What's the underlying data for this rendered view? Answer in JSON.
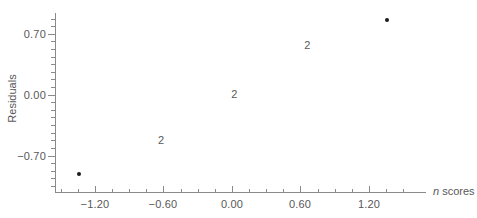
{
  "chart_data": {
    "type": "scatter",
    "title": "",
    "xlabel": "n scores",
    "ylabel": "Residuals",
    "xlim": [
      -1.55,
      1.7
    ],
    "ylim": [
      -1.12,
      0.94
    ],
    "grid": false,
    "legend": null,
    "x_ticks": [
      {
        "value": -1.2,
        "label": "-1.20"
      },
      {
        "value": -0.6,
        "label": "-0.60"
      },
      {
        "value": 0.0,
        "label": "0.00"
      },
      {
        "value": 0.6,
        "label": "0.60"
      },
      {
        "value": 1.2,
        "label": "1.20"
      }
    ],
    "y_ticks": [
      {
        "value": 0.7,
        "label": "0.70"
      },
      {
        "value": 0.0,
        "label": "0.00"
      },
      {
        "value": -0.7,
        "label": "-0.70"
      }
    ],
    "x_minor_ticks": [
      -1.5,
      -1.35,
      -1.05,
      -0.9,
      -0.75,
      -0.45,
      -0.3,
      -0.15,
      0.15,
      0.3,
      0.45,
      0.75,
      0.9,
      1.05,
      1.35,
      1.5
    ],
    "y_minor_ticks": [
      0.875,
      0.7875,
      0.6125,
      0.525,
      0.4375,
      0.35,
      0.2625,
      0.175,
      0.0875,
      -0.0875,
      -0.175,
      -0.2625,
      -0.35,
      -0.4375,
      -0.525,
      -0.6125,
      -0.7875,
      -0.875,
      -0.9625,
      -1.05
    ],
    "points": [
      {
        "x": -1.34,
        "y": -0.91,
        "count": 1,
        "marker": "dot"
      },
      {
        "x": -0.62,
        "y": -0.53,
        "count": 2,
        "marker": "count-label",
        "label": "2"
      },
      {
        "x": 0.02,
        "y": 0.0,
        "count": 2,
        "marker": "count-label",
        "label": "2"
      },
      {
        "x": 0.66,
        "y": 0.56,
        "count": 2,
        "marker": "count-label",
        "label": "2"
      },
      {
        "x": 1.36,
        "y": 0.86,
        "count": 1,
        "marker": "dot"
      }
    ],
    "colors": {
      "axis": "#8a8a8c",
      "text": "#58585a",
      "marker": "#1a1a1a",
      "background": "#ffffff"
    }
  }
}
